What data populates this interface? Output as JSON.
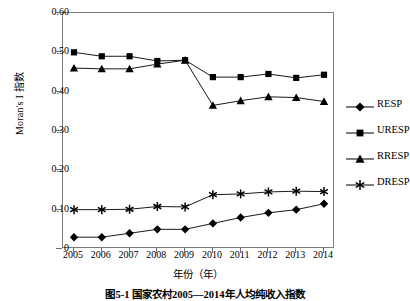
{
  "chart_data": {
    "type": "line",
    "title": "",
    "xlabel": "年份（年）",
    "ylabel": "Moran's I 指数",
    "x": [
      2005,
      2006,
      2007,
      2008,
      2009,
      2010,
      2011,
      2012,
      2013,
      2014
    ],
    "xticklabels": [
      "2005",
      "2006",
      "2007",
      "2008",
      "2009",
      "2010",
      "2011",
      "2012",
      "2013",
      "2014"
    ],
    "yticklabels": [
      "0",
      "0.10",
      "0.20",
      "0.30",
      "0.40",
      "0.50",
      "0.60"
    ],
    "ytickvalues": [
      0,
      0.1,
      0.2,
      0.3,
      0.4,
      0.5,
      0.6
    ],
    "ylim": [
      0,
      0.6
    ],
    "xlim": [
      2005,
      2014
    ],
    "grid": false,
    "legend_position": "right",
    "series": [
      {
        "name": "RESP",
        "marker": "diamond",
        "color": "#000000",
        "values": [
          0.03,
          0.03,
          0.04,
          0.05,
          0.05,
          0.065,
          0.08,
          0.092,
          0.1,
          0.115
        ]
      },
      {
        "name": "URESP",
        "marker": "square",
        "color": "#000000",
        "values": [
          0.5,
          0.49,
          0.49,
          0.478,
          0.48,
          0.437,
          0.437,
          0.445,
          0.435,
          0.443
        ]
      },
      {
        "name": "RRESP",
        "marker": "triangle",
        "color": "#000000",
        "values": [
          0.46,
          0.458,
          0.458,
          0.47,
          0.48,
          0.365,
          0.377,
          0.387,
          0.385,
          0.375
        ]
      },
      {
        "name": "DRESP",
        "marker": "asterisk",
        "color": "#000000",
        "values": [
          0.1,
          0.1,
          0.101,
          0.108,
          0.107,
          0.138,
          0.14,
          0.145,
          0.147,
          0.146
        ]
      }
    ]
  },
  "legend": {
    "items": [
      {
        "label": "RESP",
        "marker": "diamond"
      },
      {
        "label": "URESP",
        "marker": "square"
      },
      {
        "label": "RRESP",
        "marker": "triangle"
      },
      {
        "label": "DRESP",
        "marker": "asterisk"
      }
    ]
  },
  "caption": "图5-1  国家农村2005—2014年人均纯收入指数"
}
